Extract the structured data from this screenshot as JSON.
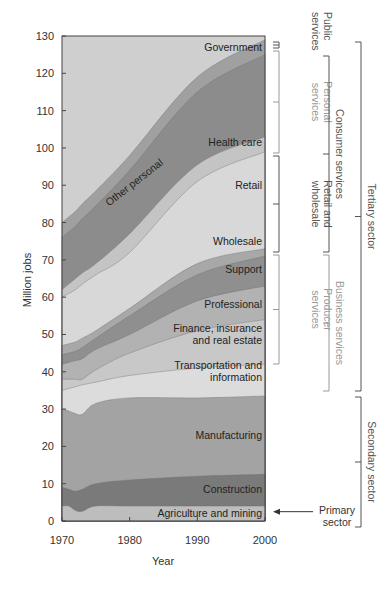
{
  "chart_data": {
    "type": "area",
    "stacked": true,
    "title": "",
    "xlabel": "Year",
    "ylabel": "Million jobs",
    "xlim": [
      1970,
      2000
    ],
    "ylim": [
      0,
      130
    ],
    "x_ticks": [
      1970,
      1980,
      1990,
      2000
    ],
    "y_ticks": [
      0,
      10,
      20,
      30,
      40,
      50,
      60,
      70,
      80,
      90,
      100,
      110,
      120,
      130
    ],
    "grid": false,
    "x": [
      1970,
      1971,
      1972,
      1973,
      1975,
      1980,
      1990,
      2000
    ],
    "series_note": "values are cumulative top boundaries of each stacked band (million jobs)",
    "series": [
      {
        "name": "Agriculture and mining",
        "color": "#bdbdbd",
        "top": [
          4,
          4,
          2.8,
          2.6,
          4,
          4,
          4,
          4
        ]
      },
      {
        "name": "Construction",
        "color": "#7a7a7a",
        "top": [
          9,
          8.5,
          8,
          8.5,
          10,
          11,
          12,
          12.5
        ]
      },
      {
        "name": "Manufacturing",
        "color": "#a3a3a3",
        "top": [
          30,
          29.5,
          28.8,
          28.6,
          31.5,
          33,
          33,
          33.5
        ]
      },
      {
        "name": "Transportation and information",
        "color": "#dcdcdc",
        "top": [
          35,
          35.5,
          36,
          36.5,
          37.2,
          39,
          41,
          42
        ]
      },
      {
        "name": "Finance, insurance and real estate",
        "color": "#c8c8c8",
        "top": [
          38,
          38,
          38,
          38,
          40.5,
          45,
          51,
          54
        ]
      },
      {
        "name": "Professional",
        "color": "#b2b2b2",
        "top": [
          42,
          42.5,
          43,
          43.5,
          46,
          50,
          59,
          63
        ]
      },
      {
        "name": "Support",
        "color": "#8f8f8f",
        "top": [
          44.5,
          45,
          45.5,
          46.5,
          49,
          55,
          66,
          71
        ]
      },
      {
        "name": "Wholesale",
        "color": "#a8a8a8",
        "top": [
          47,
          47.5,
          48,
          49,
          51,
          57,
          69,
          73
        ]
      },
      {
        "name": "Retail",
        "color": "#d8d8d8",
        "top": [
          60,
          61,
          62,
          63.5,
          66,
          72,
          91,
          99
        ]
      },
      {
        "name": "Health care",
        "color": "#c4c4c4",
        "top": [
          62,
          63.5,
          65,
          66.5,
          69,
          77,
          95.5,
          103
        ]
      },
      {
        "name": "Other personal",
        "color": "#8c8c8c",
        "top": [
          76,
          77.5,
          79,
          81,
          84.5,
          94,
          115,
          125
        ]
      },
      {
        "name": "Government",
        "color": "#a0a0a0",
        "top": [
          80,
          81.5,
          83,
          85,
          88.5,
          98,
          119,
          129
        ]
      }
    ],
    "background_color": "#cfcfcf",
    "band_labels": [
      {
        "text": [
          "Government"
        ],
        "x": 2000,
        "y": 126,
        "anchor": "end"
      },
      {
        "text": [
          "Health care"
        ],
        "x": 2000,
        "y": 100.5,
        "anchor": "end"
      },
      {
        "text": [
          "Retail"
        ],
        "x": 2000,
        "y": 89,
        "anchor": "end"
      },
      {
        "text": [
          "Wholesale"
        ],
        "x": 2000,
        "y": 74,
        "anchor": "end"
      },
      {
        "text": [
          "Support"
        ],
        "x": 2000,
        "y": 66.5,
        "anchor": "end"
      },
      {
        "text": [
          "Professional"
        ],
        "x": 2000,
        "y": 57,
        "anchor": "end"
      },
      {
        "text": [
          "Finance, insurance",
          "and real estate"
        ],
        "x": 2000,
        "y": 47.5,
        "anchor": "end"
      },
      {
        "text": [
          "Transportation and",
          "information"
        ],
        "x": 2000,
        "y": 37.5,
        "anchor": "end"
      },
      {
        "text": [
          "Manufacturing"
        ],
        "x": 2000,
        "y": 22,
        "anchor": "end"
      },
      {
        "text": [
          "Construction"
        ],
        "x": 2000,
        "y": 7.5,
        "anchor": "end"
      },
      {
        "text": [
          "Agriculture and mining"
        ],
        "x": 2000,
        "y": 1.2,
        "anchor": "end"
      },
      {
        "text": [
          "Other personal"
        ],
        "x": 1981,
        "y": 90,
        "anchor": "middle",
        "rotate": -38
      }
    ],
    "annotations": {
      "brackets": [
        {
          "label": [
            "Public",
            "services"
          ],
          "level": 1,
          "y_top_px": 42,
          "y_bot_px": 48,
          "color": "#555555"
        },
        {
          "label": [
            "Personal",
            "services"
          ],
          "level": 1,
          "y_top_px": 51,
          "y_bot_px": 153,
          "color": "#9a9a9a"
        },
        {
          "label": [
            "Retail and",
            "wholesale"
          ],
          "level": 1,
          "y_top_px": 156,
          "y_bot_px": 252,
          "color": "#555555"
        },
        {
          "label": [
            "Producer",
            "services"
          ],
          "level": 1,
          "y_top_px": 255,
          "y_bot_px": 364,
          "color": "#9a9a9a"
        },
        {
          "label": [
            "Consumer services"
          ],
          "level": 2,
          "y_top_px": 56,
          "y_bot_px": 252,
          "color": "#555555"
        },
        {
          "label": [
            "Business services"
          ],
          "level": 2,
          "y_top_px": 255,
          "y_bot_px": 391,
          "color": "#9a9a9a"
        },
        {
          "label": [
            "Tertiary sector"
          ],
          "level": 3,
          "y_top_px": 42,
          "y_bot_px": 391,
          "color": "#555555"
        },
        {
          "label": [
            "Secondary sector"
          ],
          "level": 3,
          "y_top_px": 397,
          "y_bot_px": 527,
          "color": "#555555"
        }
      ],
      "primary_arrow": {
        "label": [
          "Primary",
          "sector"
        ],
        "y": 2.5
      }
    }
  }
}
